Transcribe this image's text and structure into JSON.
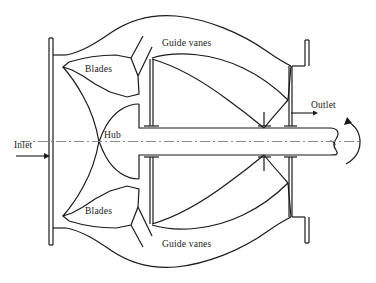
{
  "figure": {
    "kind": "axial-flow-pump-cross-section",
    "background_color": "#ffffff",
    "line_color": "#1a1a1a",
    "axis_color": "#7a7a7a"
  },
  "labels": {
    "guide_vanes_top": "Guide vanes",
    "guide_vanes_bottom": "Guide vanes",
    "blades_top": "Blades",
    "blades_bottom": "Blades",
    "hub": "Hub",
    "inlet": "Inlet",
    "outlet": "Outlet"
  },
  "annotations": {
    "inlet_arrow": "arrow-right",
    "outlet_arrow": "arrow-right",
    "rotation_arrow": "circular-rotation-arrow",
    "centerline": "dash-dot-centerline"
  }
}
